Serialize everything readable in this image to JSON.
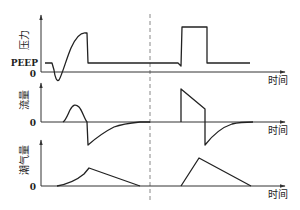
{
  "diagram": {
    "title": "",
    "divider": "dashed",
    "panels": [
      {
        "id": "pressure",
        "ylabel": "压力",
        "xlabel": "时间",
        "zero_label": "0",
        "baseline_label": "PEEP"
      },
      {
        "id": "flow",
        "ylabel": "流量",
        "xlabel": "时间",
        "zero_label": "0"
      },
      {
        "id": "tidal_volume",
        "ylabel": "潮气量",
        "xlabel": "时间",
        "zero_label": "0"
      }
    ],
    "modes": [
      {
        "side": "left",
        "description": "assisted breath with patient trigger (negative pressure dip), rising pressure, decelerating flow peak"
      },
      {
        "side": "right",
        "description": "square-wave pressure, decelerating flow ramp, triangular volume"
      }
    ]
  }
}
